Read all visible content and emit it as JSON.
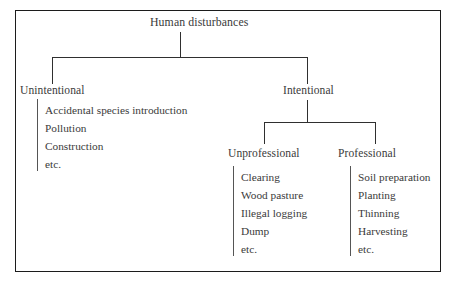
{
  "diagram": {
    "title": "Human disturbances",
    "root": {
      "label": "Human disturbances"
    },
    "branches": [
      {
        "label": "Unintentional",
        "items": [
          "Accidental species introduction",
          "Pollution",
          "Construction",
          "etc."
        ]
      },
      {
        "label": "Intentional",
        "children": [
          {
            "label": "Unprofessional",
            "items": [
              "Clearing",
              "Wood pasture",
              "Illegal logging",
              "Dump",
              "etc."
            ]
          },
          {
            "label": "Professional",
            "items": [
              "Soil preparation",
              "Planting",
              "Thinning",
              "Harvesting",
              "etc."
            ]
          }
        ]
      }
    ]
  },
  "colors": {
    "ink": "#3a3a3a",
    "line": "#2f2f2f",
    "frame": "#1c1c1c",
    "background": "#ffffff"
  }
}
